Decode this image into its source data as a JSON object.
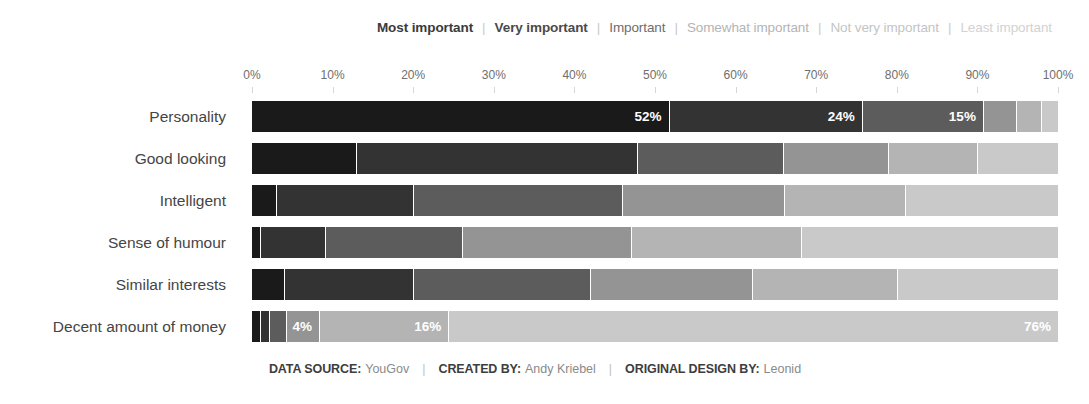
{
  "legend": {
    "separator": "|",
    "items": [
      {
        "label": "Most important",
        "color": "#1a1a1a",
        "text_color": "#3a3a3a"
      },
      {
        "label": "Very important",
        "color": "#333333",
        "text_color": "#4a4a4a"
      },
      {
        "label": "Important",
        "color": "#5c5c5c",
        "text_color": "#6d6d6d"
      },
      {
        "label": "Somewhat important",
        "color": "#949494",
        "text_color": "#b4b4b4"
      },
      {
        "label": "Not very important",
        "color": "#b4b4b4",
        "text_color": "#c4c4c4"
      },
      {
        "label": "Least important",
        "color": "#c9c9c9",
        "text_color": "#d2d2d2"
      }
    ]
  },
  "axis": {
    "ticks": [
      "0%",
      "10%",
      "20%",
      "30%",
      "40%",
      "50%",
      "60%",
      "70%",
      "80%",
      "90%",
      "100%"
    ]
  },
  "footer": {
    "items": [
      {
        "key": "DATA SOURCE:",
        "value": "YouGov"
      },
      {
        "key": "CREATED BY:",
        "value": "Andy Kriebel"
      },
      {
        "key": "ORIGINAL DESIGN BY:",
        "value": "Leonid"
      }
    ],
    "separator": "|"
  },
  "chart_data": {
    "type": "bar",
    "subtype": "stacked-100-horizontal",
    "title": "",
    "xlabel": "",
    "ylabel": "",
    "xlim": [
      0,
      100
    ],
    "grid": false,
    "legend_position": "top-right",
    "categories": [
      "Personality",
      "Good looking",
      "Intelligent",
      "Sense of humour",
      "Similar interests",
      "Decent amount of money"
    ],
    "series": [
      {
        "name": "Most important",
        "color": "#1a1a1a",
        "values": [
          52,
          13,
          3,
          1,
          4,
          1
        ]
      },
      {
        "name": "Very important",
        "color": "#333333",
        "values": [
          24,
          35,
          17,
          8,
          16,
          1
        ]
      },
      {
        "name": "Important",
        "color": "#5c5c5c",
        "values": [
          15,
          18,
          26,
          17,
          22,
          2
        ]
      },
      {
        "name": "Somewhat important",
        "color": "#949494",
        "values": [
          4,
          13,
          20,
          21,
          20,
          4
        ]
      },
      {
        "name": "Not very important",
        "color": "#b4b4b4",
        "values": [
          3,
          11,
          15,
          21,
          18,
          16
        ]
      },
      {
        "name": "Least important",
        "color": "#c9c9c9",
        "values": [
          2,
          10,
          19,
          32,
          20,
          76
        ]
      }
    ],
    "value_labels": {
      "Personality": {
        "Most important": "52%",
        "Very important": "24%",
        "Important": "15%"
      },
      "Decent amount of money": {
        "Somewhat important": "4%",
        "Not very important": "16%",
        "Least important": "76%"
      }
    }
  }
}
